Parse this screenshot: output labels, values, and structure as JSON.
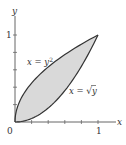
{
  "chart_data": {
    "type": "area",
    "title": "",
    "xlabel": "x",
    "ylabel": "y",
    "xlim": [
      0,
      1.2
    ],
    "ylim": [
      0,
      1.15
    ],
    "x_ticks": [
      0.2,
      0.4,
      0.6,
      0.8,
      1.0
    ],
    "y_ticks": [
      0.2,
      0.4,
      0.6,
      0.8,
      1.0
    ],
    "tick_labels": {
      "origin": "0",
      "x_one": "1",
      "y_one": "1"
    },
    "grid": false,
    "series": [
      {
        "name": "x = y^2",
        "label_text": "x = y",
        "label_sup": "2",
        "points": [
          [
            0,
            0
          ],
          [
            0.01,
            0.1
          ],
          [
            0.04,
            0.2
          ],
          [
            0.09,
            0.3
          ],
          [
            0.16,
            0.4
          ],
          [
            0.25,
            0.5
          ],
          [
            0.36,
            0.6
          ],
          [
            0.49,
            0.7
          ],
          [
            0.64,
            0.8
          ],
          [
            0.81,
            0.9
          ],
          [
            1,
            1
          ]
        ]
      },
      {
        "name": "x = sqrt(y)",
        "label_text": "x = ",
        "label_root": "y",
        "points": [
          [
            0,
            0
          ],
          [
            0.1,
            0.01
          ],
          [
            0.2,
            0.04
          ],
          [
            0.3,
            0.09
          ],
          [
            0.4,
            0.16
          ],
          [
            0.5,
            0.25
          ],
          [
            0.6,
            0.36
          ],
          [
            0.7,
            0.49
          ],
          [
            0.8,
            0.64
          ],
          [
            0.9,
            0.81
          ],
          [
            1,
            1
          ]
        ]
      }
    ],
    "shaded_region": {
      "between": [
        "x = y^2",
        "x = sqrt(y)"
      ],
      "x_range": [
        0,
        1
      ],
      "fill": "#d9d9d9"
    },
    "colors": {
      "axis": "#555555",
      "curve": "#333333",
      "fill": "#d9d9d9"
    }
  }
}
